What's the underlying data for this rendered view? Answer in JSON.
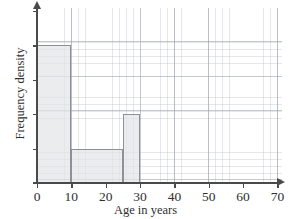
{
  "chart_data": {
    "type": "bar",
    "title": "",
    "xlabel": "Age in years",
    "ylabel": "Frequency density",
    "xlim": [
      0,
      70
    ],
    "ylim": [
      0,
      5
    ],
    "grid": true,
    "legend": "none",
    "xticks": [
      "0",
      "10",
      "20",
      "30",
      "40",
      "50",
      "60",
      "70"
    ],
    "xtick_values": [
      0,
      10,
      20,
      30,
      40,
      50,
      60,
      70
    ],
    "yticks": [
      "",
      "",
      "",
      "",
      ""
    ],
    "ytick_values": [
      1,
      2,
      3,
      4,
      5
    ],
    "bins": [
      {
        "label": "0-10",
        "start": 0,
        "end": 10,
        "frequency_density": 4
      },
      {
        "label": "10-25",
        "start": 10,
        "end": 25,
        "frequency_density": 1
      },
      {
        "label": "25-30",
        "start": 25,
        "end": 30,
        "frequency_density": 2
      }
    ],
    "colors": {
      "bar_fill": "#e2e4e7",
      "bar_stroke": "#8d9099",
      "axis": "#4a4a4a",
      "grid_minor": "#aaafb9",
      "grid_major": "#969caa"
    }
  }
}
